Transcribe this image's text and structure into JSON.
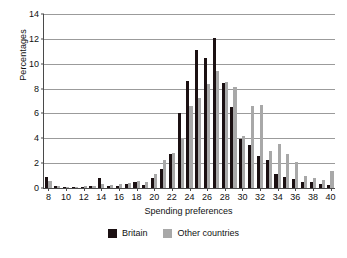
{
  "chart_data": {
    "type": "bar",
    "title": "",
    "xlabel": "Spending preferences",
    "ylabel": "Percentages",
    "xlim": [
      7.5,
      40.5
    ],
    "ylim": [
      0,
      14
    ],
    "yticks": [
      0,
      2,
      4,
      6,
      8,
      10,
      12,
      14
    ],
    "xticks": [
      8,
      10,
      12,
      14,
      16,
      18,
      20,
      22,
      24,
      26,
      28,
      30,
      32,
      34,
      36,
      38,
      40
    ],
    "grid": "horizontal",
    "legend_position": "bottom-center",
    "categories": [
      8,
      9,
      10,
      11,
      12,
      13,
      14,
      15,
      16,
      17,
      18,
      19,
      20,
      21,
      22,
      23,
      24,
      25,
      26,
      27,
      28,
      29,
      30,
      31,
      32,
      33,
      34,
      35,
      36,
      37,
      38,
      39,
      40
    ],
    "series": [
      {
        "name": "Britain",
        "color": "#1b1012",
        "values": [
          0.85,
          0.15,
          0.05,
          0.05,
          0.1,
          0.15,
          0.8,
          0.15,
          0.2,
          0.3,
          0.5,
          0.25,
          0.8,
          1.55,
          2.75,
          6.05,
          8.6,
          11.1,
          10.5,
          12.1,
          8.45,
          6.5,
          3.95,
          3.45,
          2.6,
          2.25,
          1.1,
          0.85,
          0.7,
          0.45,
          0.45,
          0.35,
          0.25
        ]
      },
      {
        "name": "Other countries",
        "color": "#a8a8a8",
        "values": [
          0.6,
          0.2,
          0.1,
          0.1,
          0.15,
          0.2,
          0.3,
          0.25,
          0.35,
          0.4,
          0.55,
          0.45,
          1.1,
          2.25,
          2.8,
          4.05,
          6.6,
          7.25,
          8.4,
          9.4,
          8.5,
          8.1,
          4.2,
          6.6,
          6.65,
          3.0,
          3.55,
          2.7,
          2.1,
          1.0,
          0.8,
          0.65,
          1.35
        ]
      }
    ]
  },
  "legend": {
    "items": [
      {
        "label": "Britain",
        "color": "#1b1012"
      },
      {
        "label": "Other countries",
        "color": "#a8a8a8"
      }
    ]
  }
}
